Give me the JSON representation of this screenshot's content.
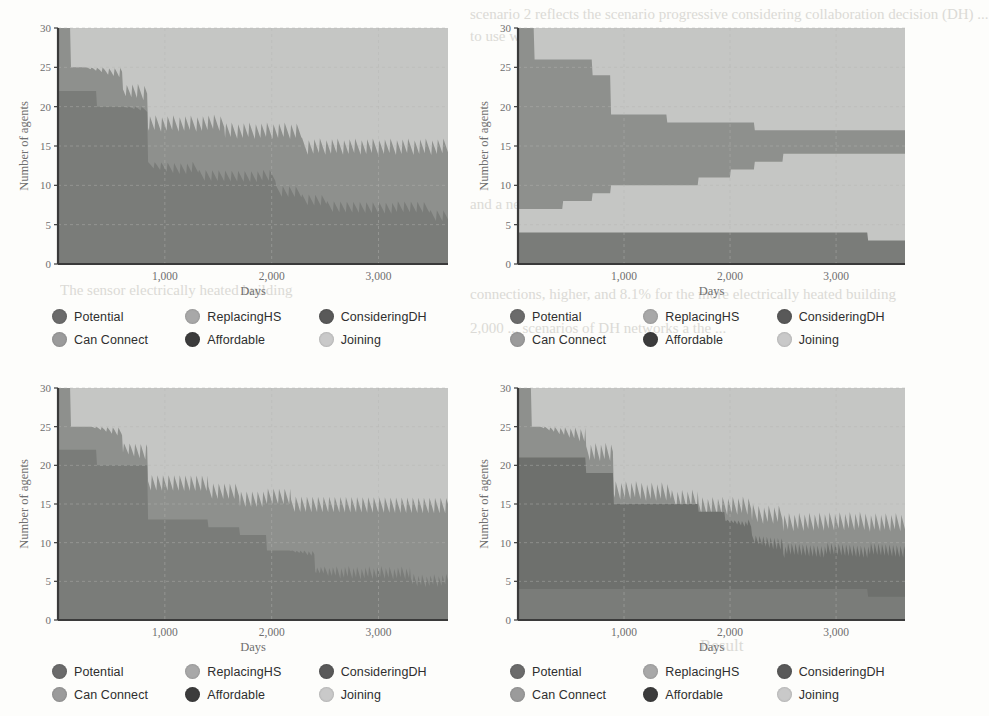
{
  "figure": {
    "panel_count": 4,
    "background_color": "#fdfdfb"
  },
  "bleed_text": [
    {
      "text": "scenario 2 reflects the scenario progressive considering collaboration decision (DH) ...",
      "x": 470,
      "y": 6,
      "size": 15
    },
    {
      "text": "to use with the new system in ...",
      "x": 470,
      "y": 28,
      "size": 15
    },
    {
      "text": "and a new DH ...",
      "x": 470,
      "y": 196,
      "size": 15
    },
    {
      "text": "connections, higher, and 8.1% for the more electrically heated building",
      "x": 470,
      "y": 286,
      "size": 15
    },
    {
      "text": "2,000 ... scenarios of DH networks a the ...",
      "x": 470,
      "y": 320,
      "size": 15
    },
    {
      "text": "The sensor electrically heated building",
      "x": 60,
      "y": 282,
      "size": 15
    },
    {
      "text": "Result",
      "x": 700,
      "y": 636,
      "size": 17
    }
  ],
  "panels": [
    {
      "id": "panel-top-left",
      "position": "top-left",
      "chart_data": {
        "type": "area",
        "title": "",
        "xlabel": "Days",
        "ylabel": "Number of agents",
        "xlim": [
          0,
          3650
        ],
        "ylim": [
          0,
          30
        ],
        "xticks": [
          1000,
          2000,
          3000
        ],
        "xticklabels": [
          "1,000",
          "2,000",
          "3,000"
        ],
        "yticks": [
          0,
          5,
          10,
          15,
          20,
          25,
          30
        ],
        "yticklabels": [
          "0",
          "5",
          "10",
          "15",
          "20",
          "25",
          "30"
        ],
        "grid": true,
        "legend_position": "below",
        "stacked": true,
        "x": [
          0,
          120,
          360,
          600,
          840,
          1080,
          1320,
          1560,
          1800,
          2040,
          2280,
          2520,
          2760,
          3000,
          3240,
          3480,
          3650
        ],
        "series": [
          {
            "name": "Potential",
            "values": [
              18,
              13,
              11,
              11,
              9,
              9,
              9,
              9,
              8,
              8,
              7,
              7,
              7,
              7,
              7,
              6,
              6
            ]
          },
          {
            "name": "ReplacingHS",
            "values": [
              0,
              0,
              0,
              0,
              0,
              0,
              0,
              0,
              0,
              0,
              0,
              0,
              0,
              0,
              0,
              0,
              0
            ]
          },
          {
            "name": "ConsideringDH",
            "values": [
              5,
              5,
              5,
              5,
              4,
              4,
              4,
              4,
              4,
              4,
              3,
              3,
              3,
              3,
              3,
              3,
              3
            ]
          },
          {
            "name": "Can Connect",
            "values": [
              4,
              4,
              4,
              4,
              3,
              3,
              3,
              3,
              3,
              3,
              3,
              3,
              3,
              3,
              3,
              3,
              3
            ]
          },
          {
            "name": "Affordable",
            "values": [
              3,
              3,
              3,
              3,
              3,
              3,
              3,
              3,
              3,
              3,
              3,
              3,
              3,
              3,
              3,
              3,
              3
            ]
          },
          {
            "name": "Joining",
            "values": [
              0,
              5,
              7,
              7,
              11,
              11,
              11,
              11,
              12,
              12,
              14,
              14,
              14,
              14,
              14,
              15,
              15
            ]
          }
        ],
        "boundaries": {
          "top_of_stack": [
            30,
            25,
            25,
            23,
            19,
            19,
            19,
            18,
            18,
            18,
            16,
            16,
            16,
            16,
            16,
            16,
            16
          ],
          "upper_envelope": [
            30,
            25,
            25,
            23,
            19,
            19,
            19,
            18,
            18,
            18,
            16,
            16,
            16,
            16,
            16,
            16,
            16
          ],
          "mid_line": [
            22,
            22,
            20,
            20,
            13,
            13,
            12,
            12,
            12,
            10,
            9,
            8,
            8,
            8,
            8,
            7,
            7
          ]
        },
        "notes": "stacked step area with high-frequency sawtooth oscillation at band tops"
      }
    },
    {
      "id": "panel-top-right",
      "position": "top-right",
      "chart_data": {
        "type": "area",
        "title": "",
        "xlabel": "Days",
        "ylabel": "Number of agents",
        "xlim": [
          0,
          3650
        ],
        "ylim": [
          0,
          30
        ],
        "xticks": [
          1000,
          2000,
          3000
        ],
        "xticklabels": [
          "1,000",
          "2,000",
          "3,000"
        ],
        "yticks": [
          0,
          5,
          10,
          15,
          20,
          25,
          30
        ],
        "yticklabels": [
          "0",
          "5",
          "10",
          "15",
          "20",
          "25",
          "30"
        ],
        "grid": true,
        "legend_position": "below",
        "stacked": true,
        "x": [
          0,
          150,
          420,
          700,
          870,
          1120,
          1400,
          1700,
          2000,
          2230,
          2500,
          2900,
          3300,
          3650
        ],
        "series": [
          {
            "name": "Potential",
            "values": [
              19,
              18,
              15,
              13,
              9,
              7,
              6,
              5,
              4,
              3,
              3,
              3,
              3,
              3
            ]
          },
          {
            "name": "ReplacingHS",
            "values": [
              0,
              0,
              0,
              0,
              0,
              0,
              0,
              0,
              0,
              0,
              0,
              0,
              0,
              0
            ]
          },
          {
            "name": "ConsideringDH",
            "values": [
              4,
              4,
              4,
              4,
              4,
              4,
              4,
              4,
              4,
              4,
              4,
              3,
              3,
              3
            ]
          },
          {
            "name": "Can Connect",
            "values": [
              3,
              3,
              4,
              5,
              6,
              6,
              6,
              6,
              6,
              7,
              7,
              7,
              7,
              7
            ]
          },
          {
            "name": "Affordable",
            "values": [
              4,
              4,
              4,
              4,
              4,
              4,
              4,
              4,
              4,
              4,
              4,
              4,
              3,
              3
            ]
          },
          {
            "name": "Joining",
            "values": [
              0,
              0,
              0,
              0,
              0,
              0,
              0,
              0,
              0,
              0,
              0,
              0,
              0,
              0
            ]
          }
        ],
        "boundaries": {
          "top_of_stack": [
            30,
            26,
            26,
            24,
            19,
            19,
            18,
            18,
            18,
            17,
            17,
            17,
            17,
            17
          ],
          "mid_upper": [
            30,
            26,
            26,
            24,
            19,
            19,
            18,
            18,
            18,
            17,
            16,
            15,
            14,
            14
          ],
          "mid_lower": [
            7,
            7,
            8,
            9,
            10,
            10,
            10,
            11,
            12,
            13,
            14,
            14,
            14,
            14
          ],
          "base": [
            4,
            4,
            4,
            4,
            4,
            4,
            4,
            4,
            4,
            4,
            4,
            4,
            3,
            3
          ]
        },
        "notes": "smooth stepped stacked area, no sawtooth; bottom band constant ~4 dropping to ~3 after 3,300"
      }
    },
    {
      "id": "panel-bottom-left",
      "position": "bottom-left",
      "chart_data": {
        "type": "area",
        "title": "",
        "xlabel": "Days",
        "ylabel": "Number of agents",
        "xlim": [
          0,
          3650
        ],
        "ylim": [
          0,
          30
        ],
        "xticks": [
          1000,
          2000,
          3000
        ],
        "xticklabels": [
          "1,000",
          "2,000",
          "3,000"
        ],
        "yticks": [
          0,
          5,
          10,
          15,
          20,
          25,
          30
        ],
        "yticklabels": [
          "0",
          "5",
          "10",
          "15",
          "20",
          "25",
          "30"
        ],
        "grid": true,
        "legend_position": "below",
        "stacked": true,
        "x": [
          0,
          120,
          360,
          600,
          840,
          1120,
          1400,
          1700,
          1950,
          2180,
          2400,
          2700,
          3000,
          3300,
          3650
        ],
        "series": [
          {
            "name": "Potential",
            "values": [
              19,
              15,
              14,
              14,
              13,
              12,
              11,
              10,
              9,
              7,
              7,
              7,
              7,
              6,
              6
            ]
          },
          {
            "name": "ReplacingHS",
            "values": [
              0,
              0,
              0,
              0,
              0,
              0,
              0,
              0,
              0,
              0,
              0,
              0,
              0,
              0,
              0
            ]
          },
          {
            "name": "ConsideringDH",
            "values": [
              6,
              6,
              6,
              6,
              5,
              5,
              5,
              5,
              5,
              5,
              5,
              5,
              5,
              5,
              5
            ]
          },
          {
            "name": "Can Connect",
            "values": [
              5,
              4,
              3,
              3,
              1,
              1,
              1,
              2,
              3,
              4,
              4,
              4,
              4,
              4,
              4
            ]
          },
          {
            "name": "Affordable",
            "values": [
              0,
              0,
              0,
              0,
              0,
              0,
              0,
              0,
              0,
              0,
              0,
              0,
              0,
              0,
              0
            ]
          },
          {
            "name": "Joining",
            "values": [
              0,
              0,
              0,
              0,
              0,
              0,
              0,
              0,
              0,
              0,
              0,
              0,
              0,
              0,
              0
            ]
          }
        ],
        "boundaries": {
          "top_of_stack": [
            30,
            25,
            25,
            23,
            19,
            19,
            18,
            17,
            17,
            16,
            16,
            16,
            16,
            16,
            16
          ],
          "mid_line": [
            22,
            22,
            20,
            20,
            13,
            13,
            12,
            11,
            9,
            9,
            7,
            7,
            7,
            6,
            6
          ]
        },
        "notes": "sawtooth oscillation on upper band from ~800 days onward, dense after 2,200"
      }
    },
    {
      "id": "panel-bottom-right",
      "position": "bottom-right",
      "chart_data": {
        "type": "area",
        "title": "",
        "xlabel": "Days",
        "ylabel": "Number of agents",
        "xlim": [
          0,
          3650
        ],
        "ylim": [
          0,
          30
        ],
        "xticks": [
          1000,
          2000,
          3000
        ],
        "xticklabels": [
          "1,000",
          "2,000",
          "3,000"
        ],
        "yticks": [
          0,
          5,
          10,
          15,
          20,
          25,
          30
        ],
        "yticklabels": [
          "0",
          "5",
          "10",
          "15",
          "20",
          "25",
          "30"
        ],
        "grid": true,
        "legend_position": "below",
        "stacked": true,
        "x": [
          0,
          130,
          400,
          640,
          900,
          1150,
          1450,
          1700,
          1950,
          2200,
          2500,
          2900,
          3300,
          3650
        ],
        "series": [
          {
            "name": "Potential",
            "values": [
              15,
              15,
              15,
              15,
              15,
              14,
              14,
              13,
              12,
              10,
              10,
              10,
              10,
              9
            ]
          },
          {
            "name": "ReplacingHS",
            "values": [
              0,
              0,
              0,
              0,
              0,
              0,
              0,
              0,
              0,
              0,
              0,
              0,
              0,
              0
            ]
          },
          {
            "name": "ConsideringDH",
            "values": [
              6,
              6,
              5,
              4,
              3,
              3,
              2,
              2,
              2,
              3,
              3,
              3,
              3,
              4
            ]
          },
          {
            "name": "Can Connect",
            "values": [
              4,
              4,
              4,
              4,
              4,
              4,
              4,
              4,
              4,
              4,
              4,
              4,
              3,
              3
            ]
          },
          {
            "name": "Affordable",
            "values": [
              0,
              0,
              0,
              0,
              0,
              0,
              0,
              0,
              0,
              0,
              0,
              0,
              0,
              0
            ]
          },
          {
            "name": "Joining",
            "values": [
              0,
              0,
              0,
              0,
              0,
              0,
              0,
              0,
              0,
              0,
              0,
              0,
              0,
              0
            ]
          }
        ],
        "boundaries": {
          "top_of_stack": [
            30,
            25,
            25,
            23,
            18,
            18,
            17,
            16,
            16,
            15,
            14,
            14,
            14,
            14
          ],
          "mid_line": [
            21,
            21,
            21,
            19,
            15,
            15,
            15,
            14,
            13,
            11,
            10,
            10,
            10,
            10
          ],
          "base": [
            4,
            4,
            4,
            4,
            4,
            4,
            4,
            4,
            4,
            4,
            4,
            4,
            3,
            3
          ]
        },
        "notes": "sawtooth from ~600 days, very dense after 2,200; bottom band ~4 dropping to ~3 near 3,300"
      }
    }
  ],
  "legend": {
    "items": [
      {
        "label": "Potential",
        "color": "#6b6b6b"
      },
      {
        "label": "ReplacingHS",
        "color": "#a8a8a8"
      },
      {
        "label": "ConsideringDH",
        "color": "#595959"
      },
      {
        "label": "Can Connect",
        "color": "#9b9b9b"
      },
      {
        "label": "Affordable",
        "color": "#3c3c3c"
      },
      {
        "label": "Joining",
        "color": "#c9c9c9"
      }
    ]
  },
  "palette": {
    "band_light": "#c5c6c4",
    "band_mid": "#8e908d",
    "band_dark": "#7a7c79",
    "band_darker": "#6e706d",
    "axis": "#3a3a3a",
    "grid": "#b6b6b4",
    "text": "#6f6f6f"
  }
}
